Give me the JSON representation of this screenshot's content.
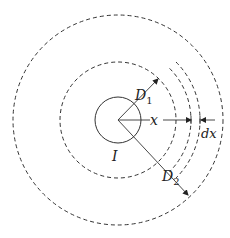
{
  "diagram": {
    "type": "concentric-cylinders-cross-section",
    "center": {
      "x": 118,
      "y": 120
    },
    "colors": {
      "stroke": "#333333",
      "background": "#ffffff"
    },
    "circles": {
      "inner_conductor": {
        "r": 23,
        "style": "solid"
      },
      "middle_dashed": {
        "r": 58,
        "style": "dashed"
      },
      "outer_dashed": {
        "r": 105,
        "style": "dashed"
      },
      "shell_inner_arc": {
        "r": 73,
        "style": "dashed-partial"
      },
      "shell_outer_arc": {
        "r": 82,
        "style": "dashed-partial"
      }
    },
    "labels": {
      "D1": {
        "main": "D",
        "sub": "1"
      },
      "D2": {
        "main": "D",
        "sub": "2"
      },
      "x": "x",
      "dx": "dx",
      "I": "I"
    }
  }
}
